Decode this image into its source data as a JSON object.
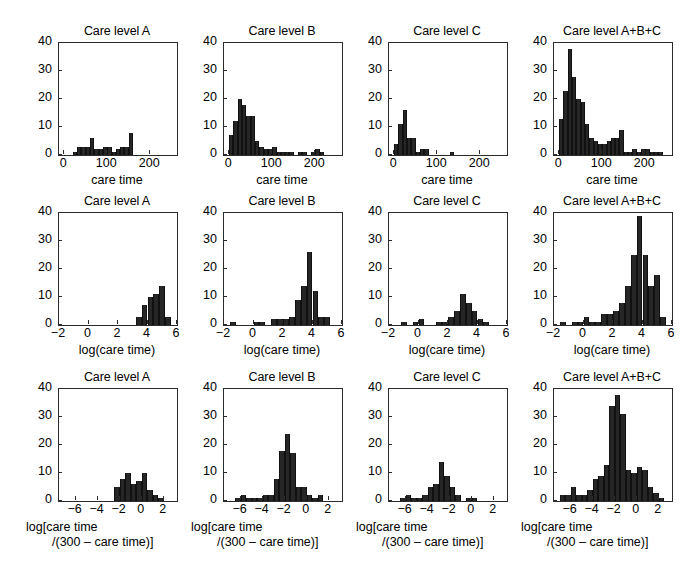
{
  "figure": {
    "background": "#ffffff",
    "bar_color": "#262626",
    "axis_color": "#2b2b2b",
    "rows": 3,
    "cols": 4
  },
  "panel_titles": {
    "a": "Care level A",
    "b": "Care level B",
    "c": "Care level C",
    "abc": "Care level A+B+C"
  },
  "axis_labels": {
    "care_time": "care time",
    "log_care_time": "log(care time)",
    "logit_line1": "log[care time",
    "logit_line2": "/(300 – care time)]"
  },
  "y_ticks": [
    "0",
    "10",
    "20",
    "30",
    "40"
  ],
  "x_ticks_row1": [
    "0",
    "100",
    "200"
  ],
  "x_ticks_row2": [
    "−2",
    "0",
    "2",
    "4",
    "6"
  ],
  "x_ticks_row3": [
    "−6",
    "−4",
    "−2",
    "0",
    "2"
  ],
  "chart_data": [
    {
      "id": "r1c1",
      "type": "bar",
      "title": "Care level A",
      "xlabel": "care time",
      "ylabel": "",
      "xlim": [
        -12,
        262
      ],
      "ylim": [
        0,
        40
      ],
      "bin_width": 10,
      "grid": false,
      "legend": "none",
      "bin_starts": [
        20,
        30,
        40,
        50,
        60,
        70,
        80,
        90,
        100,
        110,
        120,
        130,
        140,
        150,
        160,
        170,
        180,
        190,
        200,
        210,
        220,
        230,
        240
      ],
      "values": [
        1,
        3,
        3,
        3,
        6,
        2,
        2,
        3,
        3,
        1,
        2,
        3,
        3,
        8,
        0,
        0,
        0,
        0,
        0,
        0,
        0,
        0,
        0
      ]
    },
    {
      "id": "r1c2",
      "type": "bar",
      "title": "Care level B",
      "xlabel": "care time",
      "ylabel": "",
      "xlim": [
        -12,
        262
      ],
      "ylim": [
        0,
        40
      ],
      "bin_width": 10,
      "grid": false,
      "legend": "none",
      "bin_starts": [
        0,
        10,
        20,
        30,
        40,
        50,
        60,
        70,
        80,
        90,
        100,
        110,
        120,
        130,
        140,
        150,
        160,
        170,
        180,
        190,
        200,
        210,
        220
      ],
      "values": [
        7,
        12,
        20,
        18,
        14,
        14,
        5,
        3,
        2,
        2,
        3,
        1,
        1,
        1,
        1,
        0,
        1,
        1,
        0,
        1,
        2,
        1,
        0
      ]
    },
    {
      "id": "r1c3",
      "type": "bar",
      "title": "Care level C",
      "xlabel": "care time",
      "ylabel": "",
      "xlim": [
        -12,
        262
      ],
      "ylim": [
        0,
        40
      ],
      "bin_width": 10,
      "grid": false,
      "legend": "none",
      "bin_starts": [
        0,
        10,
        20,
        30,
        40,
        50,
        60,
        70,
        80,
        90,
        100,
        110,
        120,
        130,
        140
      ],
      "values": [
        4,
        11,
        16,
        6,
        6,
        1,
        2,
        2,
        0,
        0,
        0,
        0,
        0,
        1,
        0
      ]
    },
    {
      "id": "r1c4",
      "type": "bar",
      "title": "Care level A+B+C",
      "xlabel": "care time",
      "ylabel": "",
      "xlim": [
        -12,
        262
      ],
      "ylim": [
        0,
        40
      ],
      "bin_width": 10,
      "grid": false,
      "legend": "none",
      "bin_starts": [
        0,
        10,
        20,
        30,
        40,
        50,
        60,
        70,
        80,
        90,
        100,
        110,
        120,
        130,
        140,
        150,
        160,
        170,
        180,
        190,
        200,
        210,
        220,
        230,
        240
      ],
      "values": [
        13,
        23,
        38,
        28,
        20,
        19,
        11,
        6,
        5,
        4,
        4,
        5,
        6,
        6,
        9,
        1,
        1,
        2,
        1,
        2,
        2,
        1,
        1,
        1,
        0
      ]
    },
    {
      "id": "r2c1",
      "type": "bar",
      "title": "Care level A",
      "xlabel": "log(care time)",
      "ylabel": "",
      "xlim": [
        -2,
        6
      ],
      "ylim": [
        0,
        40
      ],
      "bin_width": 0.4,
      "grid": false,
      "legend": "none",
      "bin_starts": [
        3.2,
        3.6,
        4.0,
        4.4,
        4.8,
        5.2
      ],
      "values": [
        3,
        7,
        10,
        11,
        14,
        3
      ]
    },
    {
      "id": "r2c2",
      "type": "bar",
      "title": "Care level B",
      "xlabel": "log(care time)",
      "ylabel": "",
      "xlim": [
        -2,
        6
      ],
      "ylim": [
        0,
        40
      ],
      "bin_width": 0.4,
      "grid": false,
      "legend": "none",
      "bin_starts": [
        -1.6,
        -1.2,
        -0.8,
        -0.4,
        0.0,
        0.4,
        0.8,
        1.2,
        1.6,
        2.0,
        2.4,
        2.8,
        3.2,
        3.6,
        4.0,
        4.4,
        4.8
      ],
      "values": [
        1,
        0,
        0,
        0,
        1,
        1,
        0,
        2,
        2,
        2,
        3,
        9,
        14,
        26,
        12,
        3,
        3
      ]
    },
    {
      "id": "r2c3",
      "type": "bar",
      "title": "Care level C",
      "xlabel": "log(care time)",
      "ylabel": "",
      "xlim": [
        -2,
        6
      ],
      "ylim": [
        0,
        40
      ],
      "bin_width": 0.4,
      "grid": false,
      "legend": "none",
      "bin_starts": [
        -1.2,
        -0.8,
        -0.4,
        0.0,
        0.4,
        0.8,
        1.2,
        1.6,
        2.0,
        2.4,
        2.8,
        3.2,
        3.6,
        4.0,
        4.4
      ],
      "values": [
        1,
        0,
        1,
        2,
        0,
        0,
        1,
        1,
        3,
        5,
        11,
        8,
        5,
        2,
        1
      ]
    },
    {
      "id": "r2c4",
      "type": "bar",
      "title": "Care level A+B+C",
      "xlabel": "log(care time)",
      "ylabel": "",
      "xlim": [
        -2,
        6
      ],
      "ylim": [
        0,
        40
      ],
      "bin_width": 0.4,
      "grid": false,
      "legend": "none",
      "bin_starts": [
        -1.6,
        -1.2,
        -0.8,
        -0.4,
        0.0,
        0.4,
        0.8,
        1.2,
        1.6,
        2.0,
        2.4,
        2.8,
        3.2,
        3.6,
        4.0,
        4.4,
        4.8,
        5.2
      ],
      "values": [
        1,
        0,
        1,
        1,
        3,
        1,
        1,
        4,
        4,
        5,
        8,
        14,
        25,
        39,
        25,
        14,
        18,
        3
      ]
    },
    {
      "id": "r3c1",
      "type": "bar",
      "title": "Care level A",
      "xlabel": "log[care time /(300 – care time)]",
      "ylabel": "",
      "xlim": [
        -7.5,
        3.2
      ],
      "ylim": [
        0,
        40
      ],
      "bin_width": 0.5,
      "grid": false,
      "legend": "none",
      "bin_starts": [
        -2.5,
        -2.0,
        -1.5,
        -1.0,
        -0.5,
        0.0,
        0.5,
        1.0,
        1.5
      ],
      "values": [
        5,
        8,
        10,
        6,
        7,
        10,
        4,
        2,
        1
      ]
    },
    {
      "id": "r3c2",
      "type": "bar",
      "title": "Care level B",
      "xlabel": "log[care time /(300 – care time)]",
      "ylabel": "",
      "xlim": [
        -7.5,
        3.2
      ],
      "ylim": [
        0,
        40
      ],
      "bin_width": 0.5,
      "grid": false,
      "legend": "none",
      "bin_starts": [
        -6.5,
        -6.0,
        -5.5,
        -5.0,
        -4.5,
        -4.0,
        -3.5,
        -3.0,
        -2.5,
        -2.0,
        -1.5,
        -1.0,
        -0.5,
        0.0,
        0.5,
        1.0
      ],
      "values": [
        1,
        2,
        1,
        1,
        1,
        2,
        2,
        8,
        18,
        24,
        17,
        5,
        5,
        2,
        1,
        2
      ]
    },
    {
      "id": "r3c3",
      "type": "bar",
      "title": "Care level C",
      "xlabel": "log[care time /(300 – care time)]",
      "ylabel": "",
      "xlim": [
        -7.5,
        3.2
      ],
      "ylim": [
        0,
        40
      ],
      "bin_width": 0.5,
      "grid": false,
      "legend": "none",
      "bin_starts": [
        -6.5,
        -6.0,
        -5.5,
        -5.0,
        -4.5,
        -4.0,
        -3.5,
        -3.0,
        -2.5,
        -2.0,
        -1.5,
        -1.0,
        -0.5,
        0.0
      ],
      "values": [
        1,
        2,
        1,
        1,
        2,
        5,
        6,
        14,
        9,
        5,
        2,
        0,
        1,
        1
      ]
    },
    {
      "id": "r3c4",
      "type": "bar",
      "title": "Care level A+B+C",
      "xlabel": "log[care time /(300 – care time)]",
      "ylabel": "",
      "xlim": [
        -7.5,
        3.2
      ],
      "ylim": [
        0,
        40
      ],
      "bin_width": 0.5,
      "grid": false,
      "legend": "none",
      "bin_starts": [
        -7.0,
        -6.5,
        -6.0,
        -5.5,
        -5.0,
        -4.5,
        -4.0,
        -3.5,
        -3.0,
        -2.5,
        -2.0,
        -1.5,
        -1.0,
        -0.5,
        0.0,
        0.5,
        1.0,
        1.5,
        2.0
      ],
      "values": [
        2,
        2,
        5,
        2,
        2,
        4,
        8,
        9,
        13,
        34,
        38,
        31,
        11,
        10,
        12,
        11,
        5,
        3,
        1
      ]
    }
  ]
}
